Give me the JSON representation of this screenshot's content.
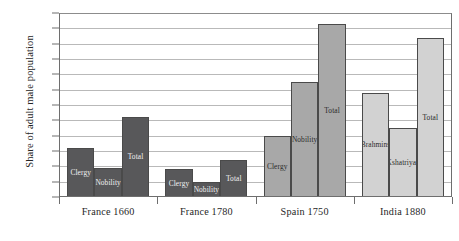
{
  "chart_data": {
    "type": "bar",
    "title": "",
    "xlabel": "",
    "ylabel": "Share of adult male population",
    "ylim": [
      0,
      12
    ],
    "ytick_labels": [
      "0%",
      "1%",
      "2%",
      "3%",
      "4%",
      "5%",
      "6%",
      "7%",
      "8%",
      "9%",
      "10%",
      "11%",
      "12%"
    ],
    "ytick_values": [
      0,
      1,
      2,
      3,
      4,
      5,
      6,
      7,
      8,
      9,
      10,
      11,
      12
    ],
    "grid": true,
    "legend": "none",
    "value_unit": "%",
    "categories": [
      "France 1660",
      "France 1780",
      "Spain 1750",
      "India 1880"
    ],
    "groups": [
      {
        "category": "France 1660",
        "shade": "dark",
        "bars": [
          {
            "label": "Clergy",
            "value": 3.2
          },
          {
            "label": "Nobility",
            "value": 1.9
          },
          {
            "label": "Total",
            "value": 5.2
          }
        ]
      },
      {
        "category": "France 1780",
        "shade": "dark",
        "bars": [
          {
            "label": "Clergy",
            "value": 1.8
          },
          {
            "label": "Nobility",
            "value": 1.0
          },
          {
            "label": "Total",
            "value": 2.4
          }
        ]
      },
      {
        "category": "Spain 1750",
        "shade": "medium",
        "bars": [
          {
            "label": "Clergy",
            "value": 4.0
          },
          {
            "label": "Nobility",
            "value": 7.5
          },
          {
            "label": "Total",
            "value": 11.3
          }
        ]
      },
      {
        "category": "India 1880",
        "shade": "light",
        "bars": [
          {
            "label": "Brahmins",
            "value": 6.8
          },
          {
            "label": "Kshatriyas",
            "value": 4.5
          },
          {
            "label": "Total",
            "value": 10.4
          }
        ]
      }
    ],
    "colors": {
      "dark": "#58585a",
      "medium": "#a8a8a8",
      "light": "#d2d2d2",
      "axis": "#6e6e6e",
      "grid": "#b9b9b9",
      "background": "#ffffff"
    }
  }
}
